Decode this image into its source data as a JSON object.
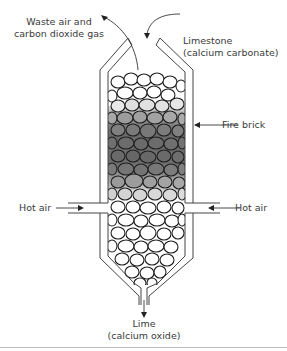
{
  "diagram": {
    "labels": {
      "waste_gas_line1": "Waste air and",
      "waste_gas_line2": "carbon dioxide gas",
      "limestone_line1": "Limestone",
      "limestone_line2": "(calcium carbonate)",
      "fire_brick": "Fire brick",
      "hot_air_left": "Hot air",
      "hot_air_right": "Hot air",
      "lime_line1": "Lime",
      "lime_line2": "(calcium oxide)"
    },
    "colors": {
      "line": "#333333",
      "hot_zone_dark": "#5a5a5a",
      "hot_zone_light": "#d8d8d8",
      "stone_fill_cool": "#ffffff",
      "divider": "#bbbbbb"
    }
  }
}
